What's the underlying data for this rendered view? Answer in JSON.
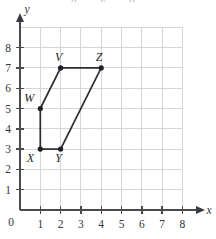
{
  "figure": {
    "name": "coordinate-grid-polygon",
    "clipped_top_text": "g y p",
    "background_color": "#ffffff",
    "grid_color": "#d6d6d8",
    "axis_color": "#4a4a4f",
    "shape_color": "#2b2b30"
  },
  "chart_data": {
    "type": "scatter",
    "title": "",
    "xlabel": "x",
    "ylabel": "y",
    "xlim": [
      0,
      8
    ],
    "ylim": [
      0,
      8
    ],
    "grid": true,
    "legend": "none",
    "x_ticks": [
      0,
      1,
      2,
      3,
      4,
      5,
      6,
      7,
      8
    ],
    "y_ticks": [
      0,
      1,
      2,
      3,
      4,
      5,
      6,
      7,
      8
    ],
    "x_tick_labels": [
      "0",
      "1",
      "2",
      "3",
      "4",
      "5",
      "6",
      "7",
      "8"
    ],
    "y_tick_labels": [
      "0",
      "1",
      "2",
      "3",
      "4",
      "5",
      "6",
      "7",
      "8"
    ],
    "series": [
      {
        "name": "polygon VZYXW",
        "closed": true,
        "points": [
          {
            "label": "W",
            "x": 1,
            "y": 5,
            "label_dx": -11,
            "label_dy": -7
          },
          {
            "label": "V",
            "x": 2,
            "y": 7,
            "label_dx": -2,
            "label_dy": -7
          },
          {
            "label": "Z",
            "x": 4,
            "y": 7,
            "label_dx": -2,
            "label_dy": -7
          },
          {
            "label": "Y",
            "x": 2,
            "y": 3,
            "label_dx": -2,
            "label_dy": 13
          },
          {
            "label": "X",
            "x": 1,
            "y": 3,
            "label_dx": -10,
            "label_dy": 13
          }
        ],
        "edges": [
          {
            "from": "W",
            "to": "V"
          },
          {
            "from": "V",
            "to": "Z"
          },
          {
            "from": "Z",
            "to": "Y"
          },
          {
            "from": "Y",
            "to": "X"
          },
          {
            "from": "X",
            "to": "W"
          }
        ]
      }
    ],
    "annotations": [
      {
        "text": "V",
        "x": 2,
        "y": 7
      },
      {
        "text": "Z",
        "x": 4,
        "y": 7
      },
      {
        "text": "W",
        "x": 1,
        "y": 5
      },
      {
        "text": "X",
        "x": 1,
        "y": 3
      },
      {
        "text": "Y",
        "x": 2,
        "y": 3
      }
    ],
    "axis_labels": {
      "x": "x",
      "y": "y"
    },
    "origin_label": "0"
  }
}
